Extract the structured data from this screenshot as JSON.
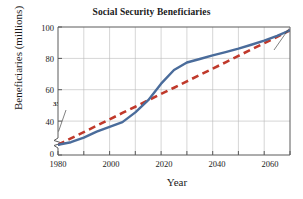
{
  "chart_data": {
    "type": "line",
    "title": "Social Security Beneficiaries",
    "xlabel": "Year",
    "ylabel": "Beneficiaries (millions)",
    "xlim": [
      1980,
      2070
    ],
    "ylim": [
      30,
      100
    ],
    "y_axis_break": true,
    "y_break_label": "0",
    "grid": true,
    "legend": "none",
    "xticks": [
      "1980",
      "2000",
      "2020",
      "2040",
      "2060"
    ],
    "xtick_values": [
      1980,
      2000,
      2020,
      2040,
      2060
    ],
    "yticks": [
      "0",
      "40",
      "60",
      "80",
      "100"
    ],
    "ytick_values": [
      0,
      40,
      60,
      80,
      100
    ],
    "x": [
      1980,
      1985,
      1990,
      1995,
      2000,
      2005,
      2010,
      2015,
      2020,
      2025,
      2030,
      2035,
      2040,
      2045,
      2050,
      2055,
      2060,
      2065,
      2070
    ],
    "series": [
      {
        "name": "actual-projected",
        "style": "solid",
        "color": "#4a6c9b",
        "values": [
          35.6,
          37.0,
          39.5,
          42.8,
          45.4,
          48.0,
          53.3,
          60.0,
          69.0,
          76.5,
          80.6,
          82.5,
          84.5,
          86.3,
          88.2,
          90.3,
          92.5,
          95.2,
          98.2
        ]
      },
      {
        "name": "linear-trend",
        "style": "dashed",
        "color": "#c0392b",
        "values": [
          35.6,
          39.1,
          42.5,
          46.0,
          49.5,
          53.0,
          56.4,
          59.9,
          63.4,
          66.8,
          70.3,
          73.8,
          77.2,
          80.7,
          84.2,
          87.7,
          91.1,
          94.6,
          98.2
        ]
      }
    ],
    "annotations": [
      {
        "label": "35.6",
        "x": 1980,
        "y": 35.6,
        "position": "upper-left"
      },
      {
        "label": "98.2",
        "x": 2070,
        "y": 98.2,
        "position": "lower-left"
      }
    ]
  }
}
